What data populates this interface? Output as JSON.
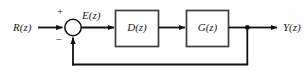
{
  "diagram": {
    "type": "control-system-block-diagram",
    "colors": {
      "background": "#fefefe",
      "wire": "#111111",
      "block_border": "#3d3d3d",
      "block_fill": "#ffffff",
      "text": "#1a1a1a"
    },
    "signals": {
      "input": "R(z)",
      "error": "E(z)",
      "output": "Y(z)"
    },
    "summing_junction": {
      "name": "summing-junction",
      "plus_sign": "+",
      "minus_sign": "−"
    },
    "blocks": [
      {
        "id": "controller",
        "label": "D(z)"
      },
      {
        "id": "plant",
        "label": "G(z)"
      }
    ],
    "feedback": {
      "label": "",
      "description": "unity feedback from output node to summing junction"
    }
  }
}
